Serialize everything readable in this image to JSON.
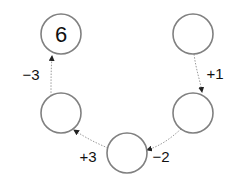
{
  "colors": {
    "circle_stroke": "#808080",
    "arrow": "#9a9a9a",
    "arrowhead": "#222222",
    "text": "#111111"
  },
  "nodes": [
    {
      "id": "top-left",
      "cx": 61,
      "cy": 34,
      "r": 20,
      "value": "6"
    },
    {
      "id": "top-right",
      "cx": 193,
      "cy": 34,
      "r": 20,
      "value": ""
    },
    {
      "id": "middle-right",
      "cx": 193,
      "cy": 113,
      "r": 20,
      "value": ""
    },
    {
      "id": "bottom",
      "cx": 127,
      "cy": 153,
      "r": 20,
      "value": ""
    },
    {
      "id": "middle-left",
      "cx": 61,
      "cy": 113,
      "r": 20,
      "value": ""
    }
  ],
  "edges": [
    {
      "from": "top-right",
      "to": "middle-right",
      "label": "+1",
      "lx": 215,
      "ly": 79
    },
    {
      "from": "middle-right",
      "to": "bottom",
      "label": "−2",
      "lx": 160,
      "ly": 162
    },
    {
      "from": "bottom",
      "to": "middle-left",
      "label": "+3",
      "lx": 75,
      "ly": 162
    },
    {
      "from": "middle-left",
      "to": "top-left",
      "label": "−3",
      "lx": 18,
      "ly": 80
    }
  ]
}
